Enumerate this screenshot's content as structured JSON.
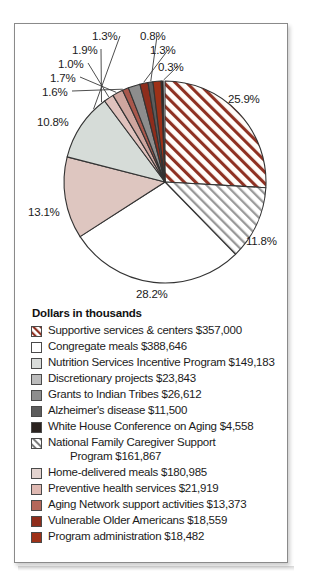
{
  "figure": {
    "legend_title": "Dollars in thousands"
  },
  "chart_data": {
    "type": "pie",
    "title": "",
    "subtitle": "",
    "xlabel": "",
    "ylabel": "",
    "units": "thousands of dollars",
    "legend_position": "below",
    "grid": false,
    "start_angle_deg": 0,
    "direction": "clockwise",
    "categories": [
      "Supportive services & centers",
      "Congregate meals",
      "Nutrition Services Incentive Program",
      "Discretionary projects",
      "Grants to Indian Tribes",
      "Alzheimer's disease",
      "White House Conference on Aging",
      "National Family Caregiver Support Program",
      "Home-delivered meals",
      "Preventive health services",
      "Aging Network support activities",
      "Vulnerable Older Americans",
      "Program administration"
    ],
    "values": [
      357000,
      388646,
      149183,
      23843,
      26612,
      11500,
      4558,
      161867,
      180985,
      21919,
      13373,
      18559,
      18482
    ],
    "percent": [
      25.9,
      28.2,
      10.8,
      1.7,
      1.9,
      0.8,
      0.3,
      11.8,
      13.1,
      1.6,
      1.0,
      1.3,
      1.3
    ],
    "slice_order_clockwise": [
      {
        "label": "Supportive services & centers",
        "percent": 25.9,
        "value_label": "$357,000",
        "fill": "hatch-red",
        "color": "#8f3122"
      },
      {
        "label": "National Family Caregiver Support Program",
        "percent": 11.8,
        "value_label": "$161,867",
        "fill": "hatch-gray",
        "color": "#9a9a9a"
      },
      {
        "label": "Congregate meals",
        "percent": 28.2,
        "value_label": "$388,646",
        "fill": "solid",
        "color": "#ffffff"
      },
      {
        "label": "Home-delivered meals",
        "percent": 13.1,
        "value_label": "$180,985",
        "fill": "solid",
        "color": "#dec6c0"
      },
      {
        "label": "Nutrition Services Incentive Program",
        "percent": 10.8,
        "value_label": "$149,183",
        "fill": "solid",
        "color": "#d6dcd8"
      },
      {
        "label": "Preventive health services",
        "percent": 1.6,
        "value_label": "$21,919",
        "fill": "solid",
        "color": "#e0c2bd"
      },
      {
        "label": "Discretionary projects",
        "percent": 1.7,
        "value_label": "$23,843",
        "fill": "solid",
        "color": "#cfa69f"
      },
      {
        "label": "Aging Network support activities",
        "percent": 1.0,
        "value_label": "$13,373",
        "fill": "solid",
        "color": "#a9584c"
      },
      {
        "label": "Grants to Indian Tribes",
        "percent": 1.9,
        "value_label": "$26,612",
        "fill": "solid",
        "color": "#8d8d8d"
      },
      {
        "label": "Vulnerable Older Americans",
        "percent": 1.3,
        "value_label": "$18,559",
        "fill": "solid",
        "color": "#8e2d1c"
      },
      {
        "label": "Alzheimer's disease",
        "percent": 0.8,
        "value_label": "$11,500",
        "fill": "solid",
        "color": "#5c5c5c"
      },
      {
        "label": "Program administration",
        "percent": 1.3,
        "value_label": "$18,482",
        "fill": "solid",
        "color": "#9e3118"
      },
      {
        "label": "White House Conference on Aging",
        "percent": 0.3,
        "value_label": "$4,558",
        "fill": "solid",
        "color": "#2b2320"
      }
    ],
    "callout_labels": [
      {
        "text": "25.9%",
        "x": 228,
        "y": 93
      },
      {
        "text": "11.8%",
        "x": 246,
        "y": 235
      },
      {
        "text": "28.2%",
        "x": 136,
        "y": 288
      },
      {
        "text": "13.1%",
        "x": 28,
        "y": 206
      },
      {
        "text": "10.8%",
        "x": 37,
        "y": 116
      },
      {
        "text": "1.6%",
        "x": 42,
        "y": 86
      },
      {
        "text": "1.7%",
        "x": 50,
        "y": 72
      },
      {
        "text": "1.0%",
        "x": 58,
        "y": 58
      },
      {
        "text": "1.9%",
        "x": 72,
        "y": 44
      },
      {
        "text": "1.3%",
        "x": 92,
        "y": 30
      },
      {
        "text": "0.8%",
        "x": 140,
        "y": 30
      },
      {
        "text": "1.3%",
        "x": 150,
        "y": 44
      },
      {
        "text": "0.3%",
        "x": 158,
        "y": 61
      }
    ]
  },
  "legend": {
    "title": "Dollars in thousands",
    "items": [
      {
        "label": "Supportive services & centers $357,000",
        "swatch": "hatch-red",
        "cont": ""
      },
      {
        "label": "Congregate meals $388,646",
        "swatch": "white",
        "cont": ""
      },
      {
        "label": "Nutrition Services Incentive Program $149,183",
        "swatch": "gray-1",
        "cont": ""
      },
      {
        "label": "Discretionary projects $23,843",
        "swatch": "gray-2",
        "cont": ""
      },
      {
        "label": "Grants to Indian Tribes $26,612",
        "swatch": "gray-3",
        "cont": ""
      },
      {
        "label": "Alzheimer's disease $11,500",
        "swatch": "gray-4",
        "cont": ""
      },
      {
        "label": "White House Conference on Aging $4,558",
        "swatch": "dark",
        "cont": ""
      },
      {
        "label": "National Family Caregiver Support",
        "swatch": "hatch-gray",
        "cont": "Program $161,867"
      },
      {
        "label": "Home-delivered meals $180,985",
        "swatch": "pink-1",
        "cont": ""
      },
      {
        "label": "Preventive health services $21,919",
        "swatch": "pink-2",
        "cont": ""
      },
      {
        "label": "Aging Network support activities $13,373",
        "swatch": "pink-3",
        "cont": ""
      },
      {
        "label": "Vulnerable Older Americans $18,559",
        "swatch": "red-1",
        "cont": ""
      },
      {
        "label": "Program administration $18,482",
        "swatch": "red-2",
        "cont": ""
      }
    ]
  },
  "colors": {
    "hatch_red": "#8f3122",
    "hatch_gray": "#9a9a9a",
    "white": "#ffffff",
    "gray_1": "#d9dcda",
    "gray_2": "#bcbcbc",
    "gray_3": "#8d8d8d",
    "gray_4": "#5c5c5c",
    "dark": "#2b2320",
    "pink_1": "#e3d3cf",
    "pink_2": "#dfb9b2",
    "pink_3": "#b4675a",
    "red_1": "#8e2d1c",
    "red_2": "#9e3118",
    "outline": "#333333",
    "frame_border": "#8a8a8a",
    "text": "#1b1b1b"
  }
}
